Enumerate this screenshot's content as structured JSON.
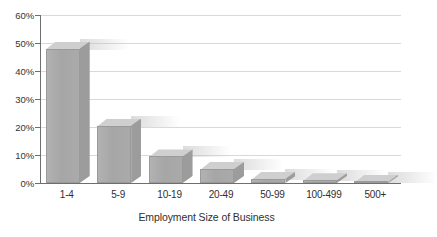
{
  "chart_data": {
    "type": "bar",
    "title": "",
    "subtitle": "",
    "xlabel": "Employment Size of Business",
    "ylabel": "",
    "categories": [
      "1-4",
      "5-9",
      "10-19",
      "20-49",
      "50-99",
      "100-499",
      "500+"
    ],
    "values": [
      48,
      20.5,
      9.5,
      5,
      1.5,
      1,
      0.3
    ],
    "ylim": [
      0,
      60
    ],
    "ytick_values": [
      0,
      10,
      20,
      30,
      40,
      50,
      60
    ],
    "ytick_labels": [
      "0%",
      "10%",
      "20%",
      "30%",
      "40%",
      "50%",
      "60%"
    ],
    "grid": true,
    "grid_axis": "y",
    "legend": false,
    "legend_position": "none",
    "style": "3d-bar",
    "series": [
      {
        "name": "Share of businesses",
        "values": [
          48,
          20.5,
          9.5,
          5,
          1.5,
          1,
          0.3
        ]
      }
    ],
    "colors": {
      "bar_front": "#a6a6a6",
      "bar_top": "#cfcfcf",
      "bar_side": "#9c9c9c",
      "gridline": "#d9d9d9",
      "axis": "#6e6e6e",
      "background": "#ffffff",
      "text": "#2f2f2f"
    }
  },
  "axes": {
    "y_ticks": [
      {
        "label": "60%",
        "value": 60
      },
      {
        "label": "50%",
        "value": 50
      },
      {
        "label": "40%",
        "value": 40
      },
      {
        "label": "30%",
        "value": 30
      },
      {
        "label": "20%",
        "value": 20
      },
      {
        "label": "10%",
        "value": 10
      },
      {
        "label": "0%",
        "value": 0
      }
    ],
    "x_title": "Employment Size of Business"
  }
}
